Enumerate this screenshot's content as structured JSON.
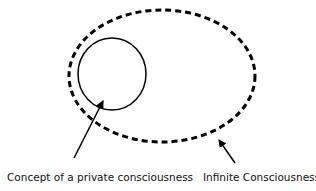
{
  "diagram": {
    "outer_region": {
      "label": "Infinite Consciousness",
      "style": "dashed ellipse",
      "color": "#000000"
    },
    "inner_region": {
      "label": "Concept of a private consciousness",
      "style": "solid circle",
      "color": "#000000"
    }
  }
}
